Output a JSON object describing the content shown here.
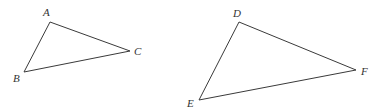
{
  "diagram": {
    "triangles": [
      {
        "name": "ABC",
        "vertices": [
          {
            "label": "A",
            "x": 50,
            "y": 22,
            "lx": 43,
            "ly": 16
          },
          {
            "label": "B",
            "x": 24,
            "y": 72,
            "lx": 13,
            "ly": 82
          },
          {
            "label": "C",
            "x": 130,
            "y": 51,
            "lx": 134,
            "ly": 55
          }
        ]
      },
      {
        "name": "DEF",
        "vertices": [
          {
            "label": "D",
            "x": 239,
            "y": 22,
            "lx": 233,
            "ly": 17
          },
          {
            "label": "E",
            "x": 199,
            "y": 100,
            "lx": 187,
            "ly": 107
          },
          {
            "label": "F",
            "x": 356,
            "y": 70,
            "lx": 361,
            "ly": 75
          }
        ]
      }
    ],
    "colors": {
      "stroke": "#3a3a3a",
      "label": "#333333",
      "background": "#ffffff"
    }
  }
}
